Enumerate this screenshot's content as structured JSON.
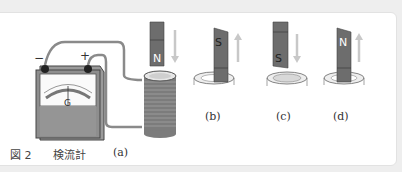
{
  "figure": {
    "number_label": "図 2",
    "galvanometer_label": "検流計",
    "meter_symbol": "G",
    "terminal_minus": "−",
    "terminal_plus": "+",
    "panels": [
      {
        "id": "a",
        "label": "(a)",
        "magnet_pole_bottom": "N",
        "motion": "down",
        "position": "above coil"
      },
      {
        "id": "b",
        "label": "(b)",
        "magnet_pole_top": "S",
        "motion": "up",
        "position": "in coil"
      },
      {
        "id": "c",
        "label": "(c)",
        "magnet_pole_bottom": "S",
        "motion": "down",
        "position": "above coil"
      },
      {
        "id": "d",
        "label": "(d)",
        "magnet_pole_top": "N",
        "motion": "up",
        "position": "in coil"
      }
    ]
  },
  "colors": {
    "magnet": "#6d6d6d",
    "arrow": "#c8c8c8",
    "wire": "#8a8a8a",
    "background": "#eeeeee",
    "panel": "#ffffff"
  }
}
